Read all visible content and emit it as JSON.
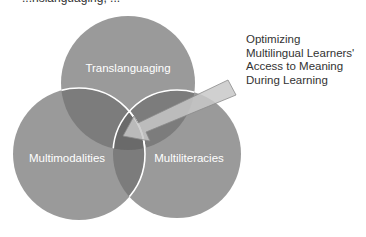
{
  "header": {
    "cut_off_text": "...nslanguaging, ..."
  },
  "diagram": {
    "type": "venn",
    "circles": [
      {
        "id": "top",
        "label": "Translanguaging",
        "cx": 128,
        "cy": 83,
        "r": 67
      },
      {
        "id": "left",
        "label": "Multimodalities",
        "cx": 79,
        "cy": 154,
        "r": 66
      },
      {
        "id": "right",
        "label": "Multiliteracies",
        "cx": 177,
        "cy": 154,
        "r": 64
      }
    ],
    "callout": {
      "lines": [
        "Optimizing",
        "Multilingual Learners'",
        "Access to Meaning",
        "During Learning"
      ],
      "points_to": "center-intersection"
    },
    "colors": {
      "circle_fill": "#9a9a9a",
      "overlap_dark": "#6f6f6f",
      "outline": "#ffffff",
      "arrow_fill": "#c4c4c4",
      "arrow_stroke": "#8a8a8a",
      "label_text": "#ffffff",
      "callout_text": "#333333"
    }
  }
}
